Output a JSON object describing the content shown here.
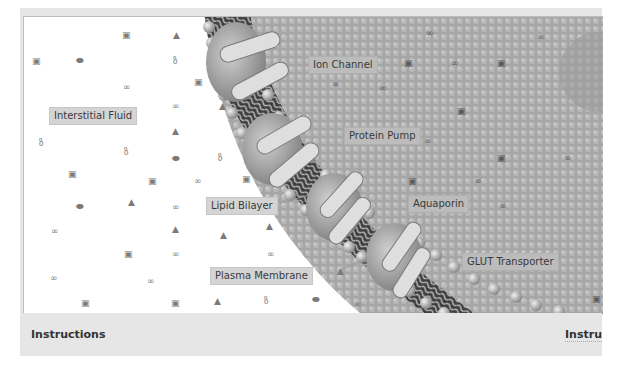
{
  "diagram": {
    "labels": {
      "interstitial_fluid": "Interstitial Fluid",
      "ion_channel": "Ion Channel",
      "protein_pump": "Protein Pump",
      "lipid_bilayer": "Lipid Bilayer",
      "aquaporin": "Aquaporin",
      "plasma_membrane": "Plasma Membrane",
      "glut_transporter": "GLUT Transporter"
    },
    "colors": {
      "background": "#ffffff",
      "cell_interior": "#a8a8a8",
      "membrane_dark": "#4a4a4a",
      "protein": "#d8d8d8",
      "label_bg": "#d4d4d4",
      "frame": "#e6e6e6"
    },
    "molecule_glyphs": {
      "square": "▣",
      "triangle": "▲",
      "pair": "∞",
      "pill": "⬬",
      "branch": "ზ"
    }
  },
  "footer": {
    "instructions_left": "Instructions",
    "instructions_right": "Instru"
  }
}
